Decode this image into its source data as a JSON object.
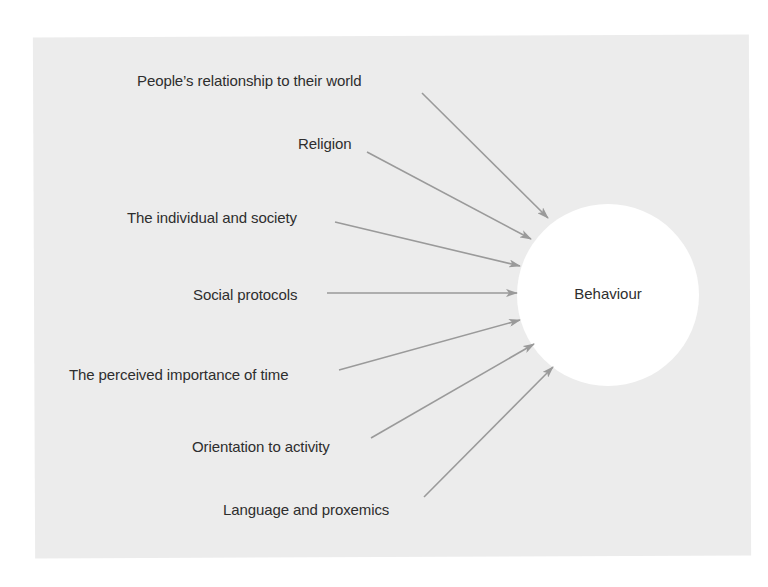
{
  "diagram": {
    "center": {
      "label": "Behaviour",
      "cx": 608,
      "cy": 295,
      "r": 91,
      "fill": "#ffffff"
    },
    "background_color": "#ececec",
    "arrow_color": "#9a9a9a",
    "text_color": "#2e2e2e",
    "factors": [
      {
        "label": "People’s relationship to their world",
        "x": 137,
        "y": 72,
        "from": [
          422,
          93
        ],
        "to": [
          548,
          218
        ]
      },
      {
        "label": "Religion",
        "x": 298,
        "y": 135,
        "from": [
          367,
          152
        ],
        "to": [
          531,
          239
        ]
      },
      {
        "label": "The individual and society",
        "x": 127,
        "y": 209,
        "from": [
          335,
          222
        ],
        "to": [
          520,
          266
        ]
      },
      {
        "label": "Social protocols",
        "x": 193,
        "y": 286,
        "from": [
          327,
          293
        ],
        "to": [
          517,
          293
        ]
      },
      {
        "label": "The perceived importance of time",
        "x": 69,
        "y": 366,
        "from": [
          339,
          370
        ],
        "to": [
          520,
          320
        ]
      },
      {
        "label": "Orientation to activity",
        "x": 192,
        "y": 438,
        "from": [
          371,
          438
        ],
        "to": [
          534,
          344
        ]
      },
      {
        "label": "Language and proxemics",
        "x": 223,
        "y": 501,
        "from": [
          424,
          497
        ],
        "to": [
          553,
          367
        ]
      }
    ]
  }
}
